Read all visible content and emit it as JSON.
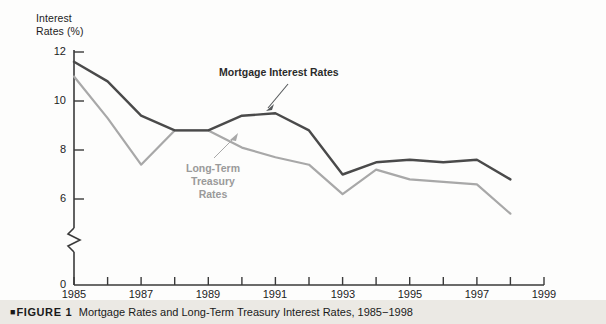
{
  "figure": {
    "caption_marker": "■",
    "caption_figure_word": "FIGURE",
    "caption_number": "1",
    "caption_text": "Mortgage Rates and Long-Term Treasury Interest Rates, 1985−1998"
  },
  "annotations": {
    "mortgage_label": "Mortgage Interest Rates",
    "treasury_label": "Long-Term\nTreasury\nRates"
  },
  "axis": {
    "y_title_line1": "Interest",
    "y_title_line2": "Rates (%)",
    "y_ticks": [
      "12",
      "10",
      "8",
      "6",
      "0"
    ],
    "x_ticks": [
      "1985",
      "1987",
      "1989",
      "1991",
      "1993",
      "1995",
      "1997",
      "1999"
    ],
    "y_axis_break": true
  },
  "colors": {
    "mortgage_line": "#4a4a4a",
    "treasury_line": "#a8a8a8",
    "axis": "#3a3a3a",
    "caption_band": "#ebe9e4",
    "background": "#fdfdfc"
  },
  "chart_data": {
    "type": "line",
    "title": "Mortgage Rates and Long-Term Treasury Interest Rates, 1985−1998",
    "xlabel": "",
    "ylabel": "Interest Rates (%)",
    "xlim": [
      1985,
      1999
    ],
    "ylim": [
      5.0,
      12.0
    ],
    "y_displayed_ticks": [
      12,
      10,
      8,
      6,
      0
    ],
    "x_displayed_ticks": [
      1985,
      1987,
      1989,
      1991,
      1993,
      1995,
      1997,
      1999
    ],
    "x_minor_tick_interval": 1,
    "y_axis_has_break": true,
    "grid": false,
    "legend": "inline-annotations",
    "x": [
      1985,
      1986,
      1987,
      1988,
      1989,
      1990,
      1991,
      1992,
      1993,
      1994,
      1995,
      1996,
      1997,
      1998
    ],
    "series": [
      {
        "name": "Mortgage Interest Rates",
        "color": "#4a4a4a",
        "values": [
          11.6,
          10.8,
          9.4,
          8.8,
          8.8,
          9.4,
          9.5,
          8.8,
          7.0,
          7.5,
          7.6,
          7.5,
          7.6,
          6.8
        ]
      },
      {
        "name": "Long-Term Treasury Rates",
        "color": "#a8a8a8",
        "values": [
          11.0,
          9.3,
          7.4,
          8.8,
          8.8,
          8.1,
          7.7,
          7.4,
          6.2,
          7.2,
          6.8,
          6.7,
          6.6,
          5.4
        ]
      }
    ]
  }
}
